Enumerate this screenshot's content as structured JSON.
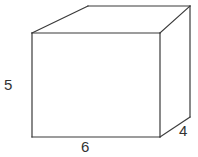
{
  "figure": {
    "name": "rectangular-prism",
    "shape_type": "rectangular prism",
    "background_color": "#ffffff",
    "stroke_color": "#3a3a3a",
    "stroke_width": 1.2,
    "label_color": "#333333"
  },
  "labels": {
    "height": "5",
    "width": "6",
    "depth": "4"
  },
  "geometry": {
    "front_face": {
      "top_left": [
        32,
        33
      ],
      "top_right": [
        160,
        33
      ],
      "bottom_right": [
        160,
        137
      ],
      "bottom_left": [
        32,
        137
      ]
    },
    "back_face": {
      "top_left": [
        88,
        6
      ],
      "top_right": [
        190,
        6
      ],
      "bottom_right": [
        190,
        117
      ]
    },
    "edges": [
      {
        "name": "front-top",
        "from": [
          32,
          33
        ],
        "to": [
          160,
          33
        ]
      },
      {
        "name": "front-right",
        "from": [
          160,
          33
        ],
        "to": [
          160,
          137
        ]
      },
      {
        "name": "front-bottom",
        "from": [
          160,
          137
        ],
        "to": [
          32,
          137
        ]
      },
      {
        "name": "front-left",
        "from": [
          32,
          137
        ],
        "to": [
          32,
          33
        ]
      },
      {
        "name": "top-back",
        "from": [
          88,
          6
        ],
        "to": [
          190,
          6
        ]
      },
      {
        "name": "top-left-diagonal",
        "from": [
          32,
          33
        ],
        "to": [
          88,
          6
        ]
      },
      {
        "name": "top-right-diagonal",
        "from": [
          160,
          33
        ],
        "to": [
          190,
          6
        ]
      },
      {
        "name": "back-right-vertical",
        "from": [
          190,
          6
        ],
        "to": [
          190,
          117
        ]
      },
      {
        "name": "bottom-right-diagonal",
        "from": [
          160,
          137
        ],
        "to": [
          190,
          117
        ]
      }
    ]
  }
}
